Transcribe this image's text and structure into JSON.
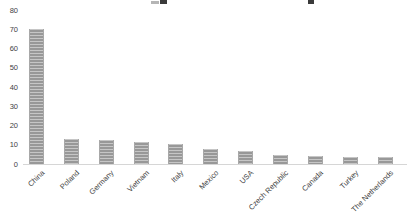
{
  "chart_data": {
    "type": "bar",
    "title": "",
    "xlabel": "",
    "ylabel": "",
    "categories": [
      "China",
      "Poland",
      "Germany",
      "Vietnam",
      "Italy",
      "Mexico",
      "USA",
      "Czech Republic",
      "Canada",
      "Turkey",
      "The Netherlands"
    ],
    "values": [
      70,
      13,
      12.5,
      11.5,
      10.5,
      8,
      7,
      4.5,
      4,
      3.5,
      3.5
    ],
    "yticks": [
      0,
      10,
      20,
      30,
      40,
      50,
      60,
      70,
      80
    ],
    "ylim": [
      0,
      80
    ],
    "grid": false,
    "legend": false,
    "bar_color": "#9e9e9e",
    "axis_line_color": "#d6d6d6",
    "tick_label_color": "#3f3f3f"
  }
}
